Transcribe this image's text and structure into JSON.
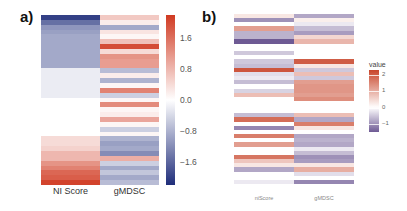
{
  "panels": {
    "a": {
      "label": "a)"
    },
    "b": {
      "label": "b)"
    }
  },
  "chart_data": [
    {
      "type": "heatmap",
      "title": "a)",
      "xlabel": "",
      "ylabel": "",
      "columns": [
        "NI Score",
        "gMDSC"
      ],
      "colorbar": {
        "title": "",
        "ticks": [
          1.6,
          0.8,
          0.0,
          -0.8,
          -1.6
        ],
        "tick_labels": [
          "1.6",
          "0.8",
          "0.0",
          "−0.8",
          "−1.6"
        ],
        "range": [
          -2.2,
          2.2
        ],
        "colors": {
          "low": "#1f2d7a",
          "mid": "#ffffff",
          "high": "#d03a22"
        }
      },
      "rows": [
        [
          -2.0,
          0.6
        ],
        [
          -1.5,
          0.2
        ],
        [
          -1.1,
          -0.9
        ],
        [
          -1.0,
          0.3
        ],
        [
          -0.9,
          0.1
        ],
        [
          -0.9,
          0.7
        ],
        [
          -0.9,
          2.0
        ],
        [
          -0.9,
          0.4
        ],
        [
          -0.9,
          1.2
        ],
        [
          -0.9,
          1.1
        ],
        [
          -0.9,
          1.1
        ],
        [
          -0.2,
          -0.7
        ],
        [
          -0.2,
          0.2
        ],
        [
          -0.2,
          -0.8
        ],
        [
          -0.2,
          0.1
        ],
        [
          -0.2,
          1.4
        ],
        [
          -0.2,
          -0.5
        ],
        [
          0.0,
          0.1
        ],
        [
          0.0,
          1.3
        ],
        [
          0.0,
          0.1
        ],
        [
          0.0,
          0.2
        ],
        [
          0.0,
          1.0
        ],
        [
          0.0,
          0.1
        ],
        [
          0.0,
          -0.5
        ],
        [
          0.0,
          0.1
        ],
        [
          0.4,
          -0.8
        ],
        [
          0.4,
          -1.0
        ],
        [
          0.5,
          -0.9
        ],
        [
          0.8,
          -1.2
        ],
        [
          0.8,
          0.9
        ],
        [
          1.2,
          -0.5
        ],
        [
          1.4,
          -0.9
        ],
        [
          1.7,
          -0.6
        ],
        [
          1.8,
          -0.9
        ],
        [
          2.1,
          -0.7
        ]
      ]
    },
    {
      "type": "heatmap",
      "title": "b)",
      "xlabel": "",
      "ylabel": "",
      "columns": [
        "niScore",
        "gMDSC"
      ],
      "row_groups": 3,
      "colorbar": {
        "title": "value",
        "ticks": [
          2,
          1,
          0,
          -1
        ],
        "tick_labels": [
          "2",
          "1",
          "0",
          "−1"
        ],
        "range": [
          -1.5,
          2.3
        ],
        "colors": {
          "low": "#6e5a94",
          "mid": "#ffffff",
          "high": "#c8452a"
        }
      },
      "groups": [
        {
          "rows": [
            [
              0.3,
              -0.8
            ],
            [
              -1.0,
              0.2
            ],
            [
              0.0,
              -0.2
            ],
            [
              1.2,
              -0.6
            ],
            [
              -0.7,
              -0.9
            ],
            [
              -0.7,
              0.5
            ],
            [
              -1.5,
              0.9
            ]
          ]
        },
        {
          "rows": [
            [
              -0.5,
              0.0
            ],
            [
              0.0,
              0.0
            ],
            [
              -0.5,
              2.0
            ],
            [
              -0.6,
              0.3
            ],
            [
              2.1,
              -0.5
            ],
            [
              -0.3,
              0.8
            ],
            [
              -0.2,
              -0.5
            ],
            [
              -0.6,
              1.2
            ],
            [
              0.0,
              1.3
            ],
            [
              -0.4,
              1.3
            ],
            [
              0.8,
              1.2
            ],
            [
              0.0,
              1.4
            ]
          ]
        },
        {
          "rows": [
            [
              0.0,
              0.0
            ],
            [
              -0.6,
              0.8
            ],
            [
              1.8,
              -0.8
            ],
            [
              0.0,
              1.6
            ],
            [
              -1.1,
              0.3
            ],
            [
              0.0,
              0.0
            ],
            [
              1.6,
              -0.8
            ],
            [
              0.0,
              -0.7
            ],
            [
              1.2,
              -0.8
            ],
            [
              0.0,
              -0.2
            ],
            [
              0.0,
              -0.6
            ],
            [
              1.7,
              -1.0
            ],
            [
              0.7,
              -0.9
            ],
            [
              0.3,
              0.3
            ],
            [
              -0.8,
              1.0
            ],
            [
              0.0,
              -0.3
            ],
            [
              0.0,
              0.0
            ],
            [
              -0.2,
              -1.1
            ]
          ]
        }
      ]
    }
  ]
}
